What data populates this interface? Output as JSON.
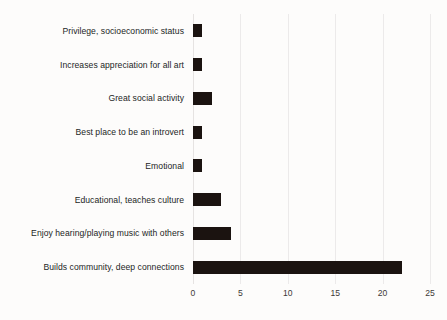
{
  "chart_data": {
    "type": "bar",
    "orientation": "horizontal",
    "title": "",
    "xlabel": "",
    "ylabel": "",
    "xlim": [
      0,
      25
    ],
    "xticks": [
      0,
      5,
      10,
      15,
      20,
      25
    ],
    "xtick_labels": [
      "0",
      "5",
      "10",
      "15",
      "20",
      "25"
    ],
    "grid": true,
    "grid_axis": "x",
    "legend": false,
    "bar_color": "#1b1310",
    "background_color": "#fdfcfb",
    "text_color": "#231f1e",
    "gridline_color": "#eceaea",
    "categories": [
      "Privilege, socioeconomic status",
      "Increases appreciation for all art",
      "Great social activity",
      "Best place to be an introvert",
      "Emotional",
      "Educational, teaches culture",
      "Enjoy hearing/playing music with others",
      "Builds community, deep connections"
    ],
    "values": [
      1,
      1,
      2,
      1,
      1,
      3,
      4,
      22
    ]
  }
}
